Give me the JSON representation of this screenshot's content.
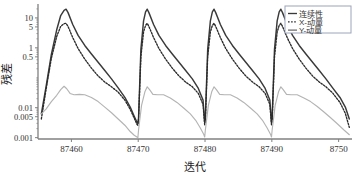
{
  "chart_data": {
    "type": "line",
    "title": "",
    "xlabel": "迭代",
    "ylabel": "残差",
    "yscale": "log",
    "xlim": [
      87455,
      87502
    ],
    "ylim": [
      0.0009,
      25
    ],
    "grid": false,
    "legend_position": "top-right",
    "xticks": [
      {
        "value": 87460,
        "label": "87460"
      },
      {
        "value": 87470,
        "label": "87470"
      },
      {
        "value": 87480,
        "label": "87480"
      },
      {
        "value": 87490,
        "label": "87490"
      },
      {
        "value": 87500,
        "label": "8750"
      }
    ],
    "yticks": [
      {
        "value": 10,
        "label": "10"
      },
      {
        "value": 5,
        "label": "5"
      },
      {
        "value": 1,
        "label": "1"
      },
      {
        "value": 0.5,
        "label": "0.5"
      },
      {
        "value": 0.01,
        "label": "0.01"
      },
      {
        "value": 0.005,
        "label": "0.005"
      },
      {
        "value": 0.001,
        "label": "0.001"
      }
    ],
    "series": [
      {
        "name": "连续性",
        "style": "solid",
        "color": "#3a3a3a",
        "points": [
          [
            87455.5,
            0.0062
          ],
          [
            87456.2,
            0.05
          ],
          [
            87457.0,
            0.6
          ],
          [
            87457.8,
            4.0
          ],
          [
            87458.4,
            12.0
          ],
          [
            87458.9,
            18.0
          ],
          [
            87459.2,
            19.5
          ],
          [
            87459.5,
            15.0
          ],
          [
            87460.2,
            6.0
          ],
          [
            87461.0,
            2.6
          ],
          [
            87462.0,
            1.2
          ],
          [
            87463.0,
            0.62
          ],
          [
            87464.0,
            0.33
          ],
          [
            87465.0,
            0.175
          ],
          [
            87466.0,
            0.092
          ],
          [
            87467.0,
            0.046
          ],
          [
            87468.0,
            0.022
          ],
          [
            87468.8,
            0.0105
          ],
          [
            87469.4,
            0.0052
          ],
          [
            87469.8,
            0.0033
          ],
          [
            87469.95,
            0.003
          ],
          [
            87470.05,
            0.0045
          ],
          [
            87470.4,
            0.9
          ],
          [
            87470.8,
            8.0
          ],
          [
            87471.1,
            16.0
          ],
          [
            87471.35,
            19.5
          ],
          [
            87471.6,
            15.0
          ],
          [
            87472.3,
            6.0
          ],
          [
            87473.1,
            2.6
          ],
          [
            87474.1,
            1.2
          ],
          [
            87475.1,
            0.62
          ],
          [
            87476.1,
            0.33
          ],
          [
            87477.1,
            0.175
          ],
          [
            87478.1,
            0.092
          ],
          [
            87479.0,
            0.044
          ],
          [
            87479.7,
            0.018
          ],
          [
            87479.95,
            0.0032
          ],
          [
            87480.05,
            0.0045
          ],
          [
            87480.4,
            0.9
          ],
          [
            87480.8,
            8.0
          ],
          [
            87481.1,
            16.0
          ],
          [
            87481.35,
            19.5
          ],
          [
            87481.6,
            15.0
          ],
          [
            87482.3,
            6.0
          ],
          [
            87483.1,
            2.6
          ],
          [
            87484.1,
            1.2
          ],
          [
            87485.1,
            0.62
          ],
          [
            87486.1,
            0.33
          ],
          [
            87487.1,
            0.175
          ],
          [
            87488.1,
            0.092
          ],
          [
            87489.0,
            0.044
          ],
          [
            87489.7,
            0.018
          ],
          [
            87489.95,
            0.0032
          ],
          [
            87490.05,
            0.0045
          ],
          [
            87490.4,
            0.9
          ],
          [
            87490.8,
            8.0
          ],
          [
            87491.1,
            16.0
          ],
          [
            87491.35,
            19.5
          ],
          [
            87491.6,
            15.0
          ],
          [
            87492.3,
            6.0
          ],
          [
            87493.1,
            2.6
          ],
          [
            87494.1,
            1.2
          ],
          [
            87495.1,
            0.62
          ],
          [
            87496.1,
            0.33
          ],
          [
            87497.1,
            0.175
          ],
          [
            87498.1,
            0.092
          ],
          [
            87499.1,
            0.046
          ],
          [
            87500.2,
            0.022
          ],
          [
            87501.0,
            0.0105
          ],
          [
            87501.6,
            0.0042
          ]
        ]
      },
      {
        "name": "X-动量",
        "style": "dotted",
        "color": "#2b2b2b",
        "points": [
          [
            87455.5,
            0.0042
          ],
          [
            87456.2,
            0.04
          ],
          [
            87457.0,
            0.45
          ],
          [
            87457.8,
            2.4
          ],
          [
            87458.4,
            5.2
          ],
          [
            87458.9,
            6.4
          ],
          [
            87459.2,
            6.6
          ],
          [
            87459.5,
            5.2
          ],
          [
            87460.2,
            2.2
          ],
          [
            87461.0,
            0.95
          ],
          [
            87462.0,
            0.42
          ],
          [
            87463.0,
            0.21
          ],
          [
            87464.0,
            0.115
          ],
          [
            87465.0,
            0.072
          ],
          [
            87466.0,
            0.05
          ],
          [
            87467.0,
            0.033
          ],
          [
            87468.0,
            0.018
          ],
          [
            87468.8,
            0.0088
          ],
          [
            87469.4,
            0.0045
          ],
          [
            87469.8,
            0.0028
          ],
          [
            87469.95,
            0.0026
          ],
          [
            87470.05,
            0.004
          ],
          [
            87470.4,
            0.5
          ],
          [
            87470.8,
            3.4
          ],
          [
            87471.1,
            5.6
          ],
          [
            87471.35,
            6.6
          ],
          [
            87471.6,
            5.2
          ],
          [
            87472.3,
            2.2
          ],
          [
            87473.1,
            0.95
          ],
          [
            87474.1,
            0.42
          ],
          [
            87475.1,
            0.21
          ],
          [
            87476.1,
            0.115
          ],
          [
            87477.1,
            0.072
          ],
          [
            87478.1,
            0.05
          ],
          [
            87479.0,
            0.03
          ],
          [
            87479.7,
            0.013
          ],
          [
            87479.95,
            0.0027
          ],
          [
            87480.05,
            0.004
          ],
          [
            87480.4,
            0.5
          ],
          [
            87480.8,
            3.4
          ],
          [
            87481.1,
            5.6
          ],
          [
            87481.35,
            6.6
          ],
          [
            87481.6,
            5.2
          ],
          [
            87482.3,
            2.2
          ],
          [
            87483.1,
            0.95
          ],
          [
            87484.1,
            0.42
          ],
          [
            87485.1,
            0.21
          ],
          [
            87486.1,
            0.115
          ],
          [
            87487.1,
            0.072
          ],
          [
            87488.1,
            0.05
          ],
          [
            87489.0,
            0.03
          ],
          [
            87489.7,
            0.013
          ],
          [
            87489.95,
            0.0027
          ],
          [
            87490.05,
            0.004
          ],
          [
            87490.4,
            0.5
          ],
          [
            87490.8,
            3.4
          ],
          [
            87491.1,
            5.6
          ],
          [
            87491.35,
            6.6
          ],
          [
            87491.6,
            5.2
          ],
          [
            87492.3,
            2.2
          ],
          [
            87493.1,
            0.95
          ],
          [
            87494.1,
            0.42
          ],
          [
            87495.1,
            0.21
          ],
          [
            87496.1,
            0.115
          ],
          [
            87497.1,
            0.072
          ],
          [
            87498.1,
            0.05
          ],
          [
            87499.1,
            0.031
          ],
          [
            87500.2,
            0.015
          ],
          [
            87501.0,
            0.0065
          ],
          [
            87501.6,
            0.0022
          ]
        ]
      },
      {
        "name": "Y-动量",
        "style": "solid-light",
        "color": "#b4b4b4",
        "points": [
          [
            87455.5,
            0.0062
          ],
          [
            87456.2,
            0.009
          ],
          [
            87457.0,
            0.016
          ],
          [
            87457.8,
            0.026
          ],
          [
            87458.4,
            0.04
          ],
          [
            87458.9,
            0.052
          ],
          [
            87459.3,
            0.043
          ],
          [
            87459.8,
            0.03
          ],
          [
            87460.4,
            0.027
          ],
          [
            87461.2,
            0.028
          ],
          [
            87462.0,
            0.027
          ],
          [
            87463.0,
            0.022
          ],
          [
            87464.0,
            0.016
          ],
          [
            87465.0,
            0.0105
          ],
          [
            87466.0,
            0.0068
          ],
          [
            87467.0,
            0.0042
          ],
          [
            87468.0,
            0.0026
          ],
          [
            87468.8,
            0.0016
          ],
          [
            87469.4,
            0.0012
          ],
          [
            87469.8,
            0.00105
          ],
          [
            87469.95,
            0.001
          ],
          [
            87470.05,
            0.0018
          ],
          [
            87470.5,
            0.012
          ],
          [
            87471.0,
            0.034
          ],
          [
            87471.35,
            0.05
          ],
          [
            87471.7,
            0.04
          ],
          [
            87472.2,
            0.028
          ],
          [
            87472.9,
            0.027
          ],
          [
            87473.8,
            0.027
          ],
          [
            87474.8,
            0.021
          ],
          [
            87475.8,
            0.015
          ],
          [
            87476.8,
            0.0098
          ],
          [
            87477.8,
            0.0062
          ],
          [
            87478.6,
            0.0038
          ],
          [
            87479.3,
            0.0021
          ],
          [
            87479.8,
            0.0013
          ],
          [
            87479.95,
            0.00105
          ],
          [
            87480.05,
            0.0018
          ],
          [
            87480.5,
            0.012
          ],
          [
            87481.0,
            0.034
          ],
          [
            87481.35,
            0.05
          ],
          [
            87481.7,
            0.04
          ],
          [
            87482.2,
            0.028
          ],
          [
            87482.9,
            0.027
          ],
          [
            87483.8,
            0.027
          ],
          [
            87484.8,
            0.021
          ],
          [
            87485.8,
            0.015
          ],
          [
            87486.8,
            0.0098
          ],
          [
            87487.8,
            0.0062
          ],
          [
            87488.6,
            0.0038
          ],
          [
            87489.3,
            0.0021
          ],
          [
            87489.8,
            0.0013
          ],
          [
            87489.95,
            0.00105
          ],
          [
            87490.05,
            0.0018
          ],
          [
            87490.5,
            0.012
          ],
          [
            87491.0,
            0.034
          ],
          [
            87491.35,
            0.05
          ],
          [
            87491.7,
            0.04
          ],
          [
            87492.2,
            0.028
          ],
          [
            87492.9,
            0.027
          ],
          [
            87493.8,
            0.027
          ],
          [
            87494.8,
            0.021
          ],
          [
            87495.8,
            0.016
          ],
          [
            87496.8,
            0.011
          ],
          [
            87497.8,
            0.0072
          ],
          [
            87498.8,
            0.0046
          ],
          [
            87499.8,
            0.0029
          ],
          [
            87500.8,
            0.0018
          ],
          [
            87501.6,
            0.00125
          ]
        ]
      }
    ]
  },
  "legend": {
    "entries": [
      {
        "label": "连续性",
        "style": "solid",
        "color": "#3a3a3a"
      },
      {
        "label": "X-动量",
        "style": "dotted",
        "color": "#2b2b2b"
      },
      {
        "label": "Y-动量",
        "style": "solid-light",
        "color": "#555555"
      }
    ]
  },
  "colors": {
    "axis": "#808080",
    "text": "#333333",
    "background": "#ffffff",
    "legend_border": "#9aa4b8"
  }
}
